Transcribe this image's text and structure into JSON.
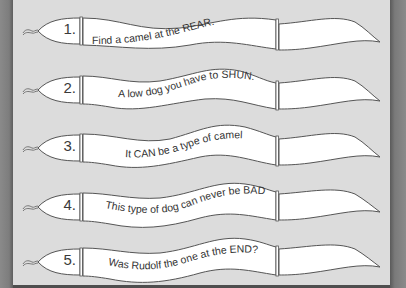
{
  "puzzle": {
    "colors": {
      "background": "#dcdcdc",
      "border": "#7d7d7d",
      "serpent_fill": "#ffffff",
      "serpent_stroke": "#555555",
      "text": "#333333"
    },
    "serpents": [
      {
        "number": "1.",
        "clue": "Find a camel at the REAR.",
        "answer": ""
      },
      {
        "number": "2.",
        "clue": "A low dog you have to SHUN.",
        "answer": ""
      },
      {
        "number": "3.",
        "clue": "It CAN be a type of camel",
        "answer": ""
      },
      {
        "number": "4.",
        "clue": "This type of dog can never be BAD!",
        "answer": ""
      },
      {
        "number": "5.",
        "clue": "Was Rudolf the one at the END?",
        "answer": ""
      }
    ]
  }
}
